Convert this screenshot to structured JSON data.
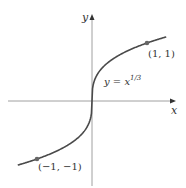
{
  "chart_data": {
    "type": "line",
    "title": "",
    "xlabel": "x",
    "ylabel": "y",
    "function": "y = x^(1/3)",
    "series": [
      {
        "name": "y = x^(1/3)",
        "x": [
          -1.35,
          -1,
          -0.5,
          -0.125,
          -0.02,
          0,
          0.02,
          0.125,
          0.5,
          1,
          1.35
        ],
        "values": [
          -1.105,
          -1,
          -0.794,
          -0.5,
          -0.271,
          0,
          0.271,
          0.5,
          0.794,
          1,
          1.105
        ]
      }
    ],
    "points": [
      {
        "x": 1,
        "y": 1,
        "label": "(1, 1)"
      },
      {
        "x": -1,
        "y": -1,
        "label": "(−1, −1)"
      }
    ],
    "grid": false,
    "legend": "none"
  },
  "labels": {
    "y_axis": "y",
    "x_axis": "x",
    "equation_lhs": "y = x",
    "equation_exp": "1/3",
    "point_pos": "(1, 1)",
    "point_neg": "(−1, −1)"
  },
  "colors": {
    "curve": "#444444",
    "axis": "#777777",
    "point": "#666666"
  }
}
